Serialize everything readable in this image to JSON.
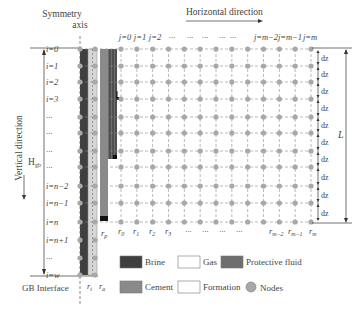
{
  "title_symmetry": [
    "Symmetry",
    "axis"
  ],
  "horizontal_label": "Horizontal direction",
  "vertical_label": "Vertical direction",
  "height_label": "H",
  "height_sub": "gb",
  "length_label": "L",
  "interface_label": "GB Interface",
  "dz_label": "dz",
  "rows": [
    {
      "label": "i=0",
      "y": 49
    },
    {
      "label": "i=1",
      "y": 66
    },
    {
      "label": "i=2",
      "y": 82
    },
    {
      "label": "i=3",
      "y": 99
    },
    {
      "label": "···",
      "y": 117
    },
    {
      "label": "···",
      "y": 133
    },
    {
      "label": "···",
      "y": 151
    },
    {
      "label": "···",
      "y": 167
    },
    {
      "label": "i=n−2",
      "y": 186
    },
    {
      "label": "i=n−1",
      "y": 203
    },
    {
      "label": "i=n",
      "y": 222
    },
    {
      "label": "i=n+1",
      "y": 240
    },
    {
      "label": "···",
      "y": 258
    },
    {
      "label": "i=w",
      "y": 275
    }
  ],
  "columns_top": [
    "j=0",
    "j=1",
    "j=2",
    "···",
    "···",
    "···",
    "···",
    "···",
    "j=m−2",
    "j=m−1",
    "j=m"
  ],
  "columns_bottom": [
    {
      "base": "r",
      "sub": "p"
    },
    {
      "base": "r",
      "sub": "0"
    },
    {
      "base": "r",
      "sub": "1"
    },
    {
      "base": "r",
      "sub": "2"
    },
    {
      "base": "r",
      "sub": "3"
    },
    {
      "base": "···",
      "sub": ""
    },
    {
      "base": "···",
      "sub": ""
    },
    {
      "base": "···",
      "sub": ""
    },
    {
      "base": "···",
      "sub": ""
    },
    {
      "base": "r",
      "sub": "m−2"
    },
    {
      "base": "r",
      "sub": "m−1"
    },
    {
      "base": "r",
      "sub": "m"
    }
  ],
  "tube_labels": [
    {
      "base": "r",
      "sub": "t"
    },
    {
      "base": "r",
      "sub": "a"
    }
  ],
  "legend": [
    {
      "label": "Brine",
      "color": "#3f3f3f",
      "kind": "swatch"
    },
    {
      "label": "Gas",
      "color": "#ffffff",
      "kind": "swatch"
    },
    {
      "label": "Protective fluid",
      "color": "#6e6e6e",
      "kind": "swatch"
    },
    {
      "label": "Cement",
      "color": "#8a8a8a",
      "kind": "swatch"
    },
    {
      "label": "Formation",
      "color": "#ffffff",
      "kind": "swatch"
    },
    {
      "label": "Nodes",
      "color": "#a8a8a8",
      "kind": "node"
    }
  ],
  "colors": {
    "brine": "#3f3f3f",
    "annulus": "#d6d6d6",
    "cement": "#8a8a8a",
    "protective": "#6e6e6e",
    "node": "#a8a8a8",
    "grid": "#8c8c8c",
    "line": "#333333"
  }
}
